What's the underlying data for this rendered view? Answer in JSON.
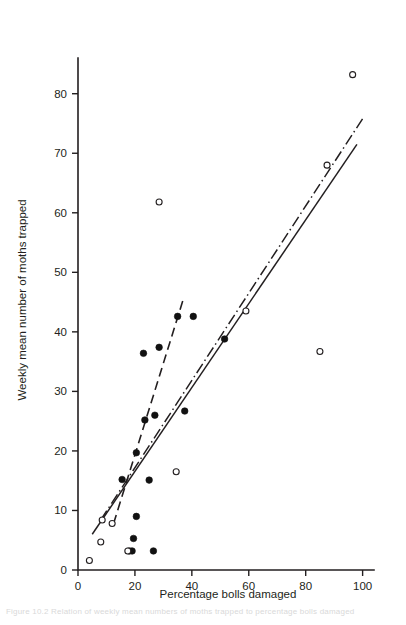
{
  "figure": {
    "background_color": "#ffffff",
    "ink_color": "#231f20",
    "caption_partial": "Figure 10.2  Relation of weekly mean numbers of moths trapped to percentage bolls damaged"
  },
  "chart_data": {
    "type": "scatter",
    "title": "",
    "xlabel": "Percentage bolls damaged",
    "ylabel": "Weekly mean number of moths trapped",
    "xlim": [
      0,
      104
    ],
    "ylim": [
      0,
      86
    ],
    "xticks": [
      0,
      20,
      40,
      60,
      80,
      100
    ],
    "yticks": [
      0,
      10,
      20,
      30,
      40,
      50,
      60,
      70,
      80
    ],
    "xtick_labels": [
      "0",
      "20",
      "40",
      "60",
      "80",
      "100"
    ],
    "ytick_labels": [
      "0",
      "10",
      "20",
      "30",
      "40",
      "50",
      "60",
      "70",
      "80"
    ],
    "grid": false,
    "legend": null,
    "series": [
      {
        "name": "filled-circles",
        "marker": "filled circle",
        "points": [
          [
            15.5,
            15.2
          ],
          [
            18.0,
            3.2
          ],
          [
            19.0,
            3.2
          ],
          [
            19.5,
            5.3
          ],
          [
            20.5,
            9.0
          ],
          [
            20.5,
            19.7
          ],
          [
            23.0,
            36.4
          ],
          [
            23.5,
            25.2
          ],
          [
            25.0,
            15.1
          ],
          [
            26.5,
            3.2
          ],
          [
            27.0,
            26.0
          ],
          [
            28.5,
            37.4
          ],
          [
            35.0,
            42.6
          ],
          [
            37.5,
            26.7
          ],
          [
            40.5,
            42.6
          ],
          [
            51.5,
            38.8
          ]
        ]
      },
      {
        "name": "open-circles",
        "marker": "open circle",
        "points": [
          [
            4.0,
            1.6
          ],
          [
            8.0,
            4.7
          ],
          [
            8.5,
            8.4
          ],
          [
            12.0,
            7.8
          ],
          [
            17.5,
            3.2
          ],
          [
            28.5,
            61.8
          ],
          [
            34.5,
            16.5
          ],
          [
            59.0,
            43.5
          ],
          [
            85.0,
            36.7
          ],
          [
            87.5,
            68.0
          ],
          [
            96.5,
            83.2
          ]
        ]
      }
    ],
    "fit_lines": [
      {
        "name": "solid-regression-line",
        "style": "solid",
        "x0": 5.0,
        "y0": 6.0,
        "x1": 98.0,
        "y1": 71.5
      },
      {
        "name": "dashed-regression-line",
        "style": "dashed",
        "x0": 12.5,
        "y0": 7.8,
        "x1": 37.0,
        "y1": 45.5
      },
      {
        "name": "dash-dot-regression-line",
        "style": "dash-dot",
        "x0": 8.0,
        "y0": 8.4,
        "x1": 100.0,
        "y1": 75.8
      }
    ]
  }
}
